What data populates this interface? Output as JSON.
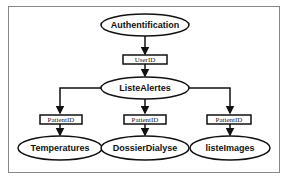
{
  "diagram": {
    "type": "flow",
    "nodes": [
      {
        "id": "auth",
        "label": "Authentification",
        "shape": "ellipse"
      },
      {
        "id": "liste",
        "label": "ListeAlertes",
        "shape": "ellipse"
      },
      {
        "id": "temp",
        "label": "Temperatures",
        "shape": "ellipse"
      },
      {
        "id": "dossier",
        "label": "DossierDialyse",
        "shape": "ellipse"
      },
      {
        "id": "images",
        "label": "listeImages",
        "shape": "ellipse"
      }
    ],
    "edges": [
      {
        "from": "auth",
        "to": "liste",
        "label": "UserID"
      },
      {
        "from": "liste",
        "to": "temp",
        "label": "PatientID"
      },
      {
        "from": "liste",
        "to": "dossier",
        "label": "PatientID"
      },
      {
        "from": "liste",
        "to": "images",
        "label": "PatientID"
      }
    ],
    "colors": {
      "stroke": "#111111",
      "background": "#ffffff",
      "frame": "#888888"
    }
  }
}
